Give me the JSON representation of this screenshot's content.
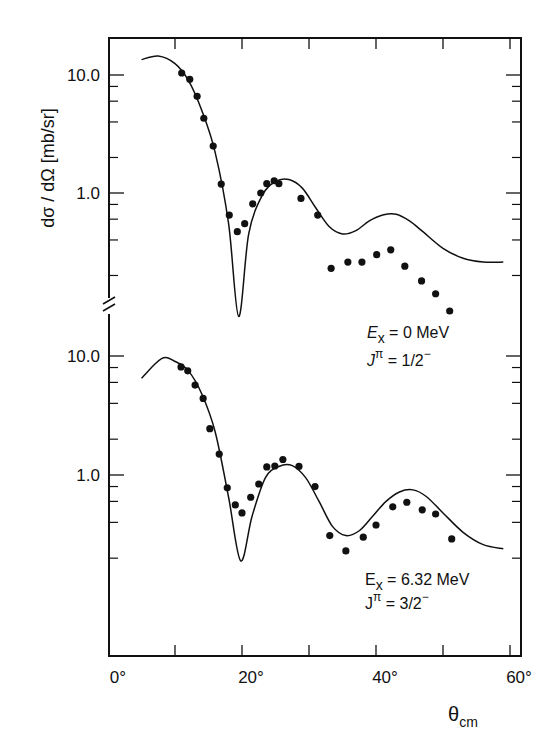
{
  "chart_data": [
    {
      "type": "scatter",
      "panel": "upper",
      "title": "",
      "xlabel": "θcm",
      "ylabel": "dσ / dΩ [mb/sr]",
      "yscale": "log",
      "ylim": [
        0.12,
        20
      ],
      "xlim": [
        0,
        62
      ],
      "annotation": {
        "line1": "Ex = 0 MeV",
        "line2": "Jπ = 1/2−"
      },
      "series": [
        {
          "name": "data",
          "marker": "filled-circle",
          "x": [
            11.0,
            12.2,
            13.3,
            14.3,
            15.7,
            16.9,
            18.1,
            19.3,
            20.4,
            21.6,
            22.8,
            23.7,
            24.8,
            25.5,
            28.8,
            31.3,
            33.3,
            35.8,
            37.9,
            40.1,
            42.2,
            44.3,
            46.8,
            48.9,
            51.0
          ],
          "y": [
            10.4,
            9.2,
            6.6,
            4.3,
            2.5,
            1.19,
            0.65,
            0.47,
            0.55,
            0.81,
            1.0,
            1.2,
            1.27,
            1.2,
            0.9,
            0.65,
            0.23,
            0.26,
            0.26,
            0.3,
            0.33,
            0.24,
            0.18,
            0.14,
            0.1
          ]
        },
        {
          "name": "calculation",
          "style": "solid-line",
          "x": [
            5,
            7.5,
            10,
            12,
            14,
            16,
            18,
            19.5,
            21,
            23,
            25,
            27,
            29,
            31,
            33,
            35,
            37,
            39,
            41,
            43,
            45,
            47,
            50,
            53,
            56,
            59
          ],
          "y": [
            13.5,
            14.5,
            12.5,
            9.0,
            5.0,
            2.2,
            0.55,
            0.09,
            0.45,
            0.95,
            1.25,
            1.3,
            1.1,
            0.75,
            0.52,
            0.45,
            0.48,
            0.58,
            0.65,
            0.66,
            0.58,
            0.47,
            0.34,
            0.28,
            0.26,
            0.26
          ]
        }
      ],
      "yticks": [
        "10.0",
        "1.0"
      ]
    },
    {
      "type": "scatter",
      "panel": "lower",
      "title": "",
      "xlabel": "θcm",
      "ylabel": "dσ / dΩ [mb/sr]",
      "yscale": "log",
      "ylim": [
        0.02,
        13
      ],
      "xlim": [
        0,
        62
      ],
      "annotation": {
        "line1": "Ex = 6.32 MeV",
        "line2": "Jπ = 3/2−"
      },
      "series": [
        {
          "name": "data",
          "marker": "filled-circle",
          "x": [
            10.9,
            11.9,
            13.0,
            14.2,
            15.2,
            16.6,
            17.8,
            19.0,
            20.0,
            21.3,
            22.5,
            23.7,
            24.9,
            26.1,
            28.5,
            30.9,
            33.1,
            35.5,
            38.1,
            40.0,
            42.5,
            44.6,
            46.9,
            48.9,
            51.3
          ],
          "y": [
            8.1,
            7.5,
            5.7,
            4.4,
            2.45,
            1.5,
            0.78,
            0.56,
            0.48,
            0.65,
            0.84,
            1.17,
            1.19,
            1.35,
            1.18,
            0.8,
            0.31,
            0.23,
            0.3,
            0.38,
            0.54,
            0.59,
            0.51,
            0.47,
            0.29
          ]
        },
        {
          "name": "calculation",
          "style": "solid-line",
          "x": [
            5,
            8,
            10,
            12,
            14,
            16,
            18,
            19.8,
            21.5,
            23.5,
            25.5,
            27.5,
            29.5,
            31.5,
            33.5,
            35.5,
            37.5,
            39.5,
            41.5,
            43.5,
            45.5,
            47.5,
            50,
            53,
            56,
            59
          ],
          "y": [
            6.5,
            9.5,
            9.0,
            7.5,
            4.8,
            2.3,
            0.65,
            0.19,
            0.45,
            0.95,
            1.18,
            1.2,
            0.95,
            0.6,
            0.37,
            0.31,
            0.34,
            0.45,
            0.6,
            0.72,
            0.75,
            0.66,
            0.48,
            0.33,
            0.26,
            0.24
          ]
        }
      ],
      "yticks": [
        "10.0",
        "1.0"
      ]
    }
  ],
  "axes": {
    "x_ticks": [
      "0°",
      "20°",
      "40°",
      "60°"
    ],
    "x_label_main": "θ",
    "x_label_sub": "cm",
    "y_label": "dσ / dΩ [mb/sr]",
    "upper_yticks": {
      "top": "10.0",
      "mid": "1.0"
    },
    "lower_yticks": {
      "top": "10.0",
      "mid": "1.0"
    }
  },
  "annotations": {
    "upper": {
      "e_sym": "E",
      "e_sub": "x",
      "e_val": " = 0 MeV",
      "j_sym": "J",
      "j_sup": "π",
      "j_val": " = 1/2",
      "j_parity": "−"
    },
    "lower": {
      "e_sym": "E",
      "e_sub": "x",
      "e_val": " = 6.32  MeV",
      "j_sym": "J",
      "j_sup": "π",
      "j_val": " = 3/2",
      "j_parity": "−"
    }
  },
  "colors": {
    "ink": "#111111",
    "background": "#ffffff"
  }
}
